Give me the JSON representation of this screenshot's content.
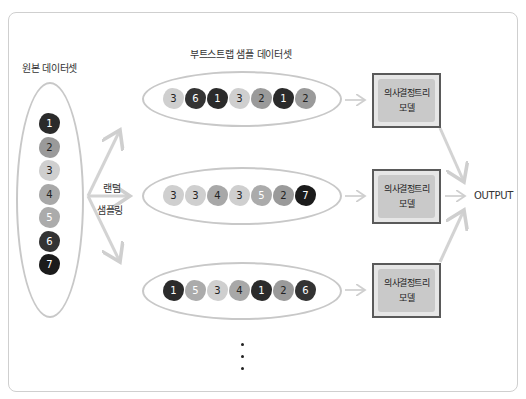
{
  "labels": {
    "original_dataset": "원본 데이터셋",
    "bootstrap_dataset": "부트스트랩 샘플 데이터셋",
    "random_line1": "랜덤",
    "random_line2": "샘플링",
    "output": "OUTPUT",
    "ellipsis": "⋮"
  },
  "colors": {
    "1": "#2b2b2b",
    "2": "#9a9a9a",
    "3": "#cfcfcf",
    "4": "#a8a8a8",
    "5": "#ababab",
    "6": "#333333",
    "7": "#1b1b1b",
    "arrow": "#d0d0d0",
    "ellipse_border": "#c8c8c8",
    "box_border": "#5a5a5a",
    "box_fill": "#c9c9c9"
  },
  "original": {
    "items": [
      "1",
      "2",
      "3",
      "4",
      "5",
      "6",
      "7"
    ]
  },
  "samples": [
    {
      "items": [
        "3",
        "6",
        "1",
        "3",
        "2",
        "1",
        "2"
      ]
    },
    {
      "items": [
        "3",
        "3",
        "4",
        "3",
        "5",
        "2",
        "7"
      ]
    },
    {
      "items": [
        "1",
        "5",
        "3",
        "4",
        "1",
        "2",
        "6"
      ]
    }
  ],
  "models": [
    {
      "line1": "의사결정트리",
      "line2": "모델"
    },
    {
      "line1": "의사결정트리",
      "line2": "모델"
    },
    {
      "line1": "의사결정트리",
      "line2": "모델"
    }
  ]
}
